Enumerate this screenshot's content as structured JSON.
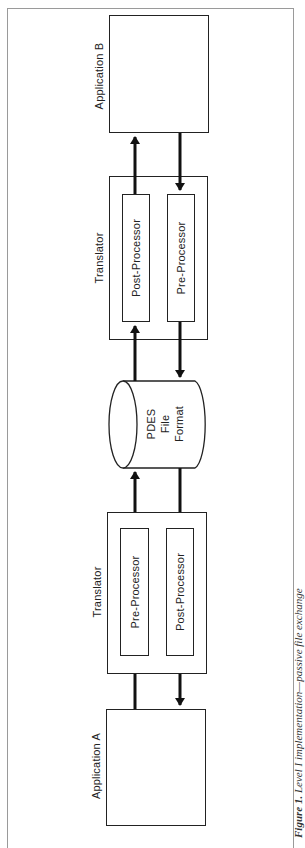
{
  "diagram": {
    "orientation": "rotated -90deg (portrait page of landscape figure)",
    "application_b": {
      "label": "Application B"
    },
    "translator_top": {
      "label": "Translator",
      "left_box": "Post-Processor",
      "right_box": "Pre-Processor"
    },
    "storage": {
      "line1": "PDES",
      "line2": "File",
      "line3": "Format"
    },
    "translator_bottom": {
      "label": "Translator",
      "left_box": "Pre-Processor",
      "right_box": "Post-Processor"
    },
    "application_a": {
      "label": "Application A"
    },
    "caption": {
      "figure_number": "Figure 1.",
      "text": "Level I implementation—passive file exchange"
    },
    "colors": {
      "line": "#222222",
      "frame": "#9a9a9a",
      "background": "#ffffff"
    }
  }
}
